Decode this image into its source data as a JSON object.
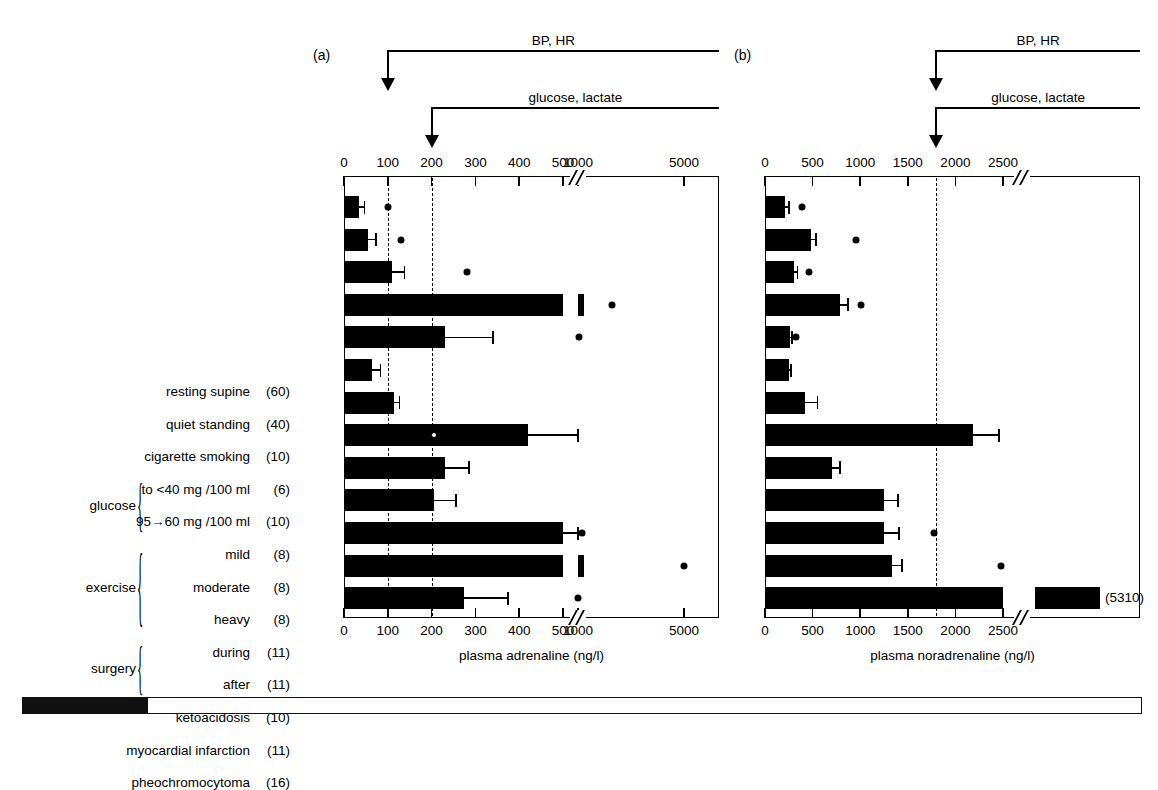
{
  "figure": {
    "panel_a_letter": "(a)",
    "panel_b_letter": "(b)",
    "callout_bp_hr": "BP, HR",
    "callout_glucose_lactate": "glucose, lactate"
  },
  "rows": [
    {
      "label": "resting supine",
      "n": "(60)"
    },
    {
      "label": "quiet standing",
      "n": "(40)"
    },
    {
      "label": "cigarette smoking",
      "n": "(10)"
    },
    {
      "label": "to <40 mg /100 ml",
      "n": "(6)"
    },
    {
      "label": "95→60 mg /100 ml",
      "n": "(10)"
    },
    {
      "label": "mild",
      "n": "(8)"
    },
    {
      "label": "moderate",
      "n": "(8)"
    },
    {
      "label": "heavy",
      "n": "(8)"
    },
    {
      "label": "during",
      "n": "(11)"
    },
    {
      "label": "after",
      "n": "(11)"
    },
    {
      "label": "ketoacidosis",
      "n": "(10)"
    },
    {
      "label": "myocardial infarction",
      "n": "(11)"
    },
    {
      "label": "pheochromocytoma",
      "n": "(16)"
    }
  ],
  "groups": [
    {
      "name": "glucose",
      "first_row": 3,
      "last_row": 4
    },
    {
      "name": "exercise",
      "first_row": 5,
      "last_row": 7
    },
    {
      "name": "surgery",
      "first_row": 8,
      "last_row": 9
    }
  ],
  "chart_data": [
    {
      "type": "bar",
      "panel": "(a)",
      "title": "",
      "xlabel": "plasma adrenaline (ng/l)",
      "ylabel": "",
      "orientation": "horizontal",
      "grid": false,
      "legend": "none",
      "axis_break": {
        "after": 500,
        "before": 1000
      },
      "tick_labels": [
        "0",
        "100",
        "200",
        "300",
        "400",
        "500",
        "1000",
        "5000"
      ],
      "tick_values": [
        0,
        100,
        200,
        300,
        400,
        500,
        1000,
        5000
      ],
      "threshold_lines": [
        {
          "value": 100,
          "label": "BP, HR"
        },
        {
          "value": 200,
          "label": "glucose, lactate"
        }
      ],
      "categories": [
        "resting supine",
        "quiet standing",
        "cigarette smoking",
        "to <40 mg /100 ml",
        "95→60 mg /100 ml",
        "mild",
        "moderate",
        "heavy",
        "during",
        "after",
        "ketoacidosis",
        "myocardial infarction",
        "pheochromocytoma"
      ],
      "values": [
        35,
        55,
        110,
        1030,
        230,
        65,
        115,
        420,
        230,
        205,
        500,
        1020,
        275
      ],
      "errors": [
        12,
        18,
        28,
        180,
        110,
        18,
        12,
        110,
        55,
        50,
        90,
        160,
        100
      ],
      "points": [
        100,
        130,
        280,
        2300,
        1050,
        null,
        null,
        205,
        null,
        null,
        1150,
        5000,
        1000
      ],
      "point_style": [
        "filled",
        "filled",
        "filled",
        "filled",
        "filled",
        null,
        null,
        "open",
        null,
        null,
        "filled",
        "filled",
        "filled"
      ],
      "bar_notes": [
        null,
        null,
        null,
        null,
        null,
        null,
        null,
        null,
        null,
        null,
        null,
        null,
        null
      ]
    },
    {
      "type": "bar",
      "panel": "(b)",
      "title": "",
      "xlabel": "plasma noradrenaline (ng/l)",
      "ylabel": "",
      "orientation": "horizontal",
      "grid": false,
      "legend": "none",
      "axis_break": {
        "after": 2500,
        "before": 5310
      },
      "tick_labels": [
        "0",
        "500",
        "1000",
        "1500",
        "2000",
        "2500"
      ],
      "tick_values": [
        0,
        500,
        1000,
        1500,
        2000,
        2500
      ],
      "threshold_lines": [
        {
          "value": 1800,
          "label": "BP, HR"
        },
        {
          "value": 1800,
          "label": "glucose, lactate"
        }
      ],
      "categories": [
        "resting supine",
        "quiet standing",
        "cigarette smoking",
        "to <40 mg /100 ml",
        "95→60 mg /100 ml",
        "mild",
        "moderate",
        "heavy",
        "during",
        "after",
        "ketoacidosis",
        "myocardial infarction",
        "pheochromocytoma"
      ],
      "values": [
        210,
        480,
        300,
        790,
        260,
        250,
        420,
        2190,
        700,
        1250,
        1250,
        1330,
        5310
      ],
      "errors": [
        40,
        55,
        40,
        80,
        25,
        25,
        130,
        270,
        90,
        150,
        160,
        110,
        0
      ],
      "points": [
        390,
        960,
        460,
        1010,
        330,
        null,
        null,
        null,
        null,
        null,
        1780,
        2480,
        null
      ],
      "point_style": [
        "filled",
        "filled",
        "filled",
        "filled",
        "filled",
        null,
        null,
        null,
        null,
        null,
        "filled",
        "filled",
        null
      ],
      "bar_notes": [
        null,
        null,
        null,
        null,
        null,
        null,
        null,
        null,
        null,
        null,
        null,
        null,
        "(5310)"
      ]
    }
  ]
}
